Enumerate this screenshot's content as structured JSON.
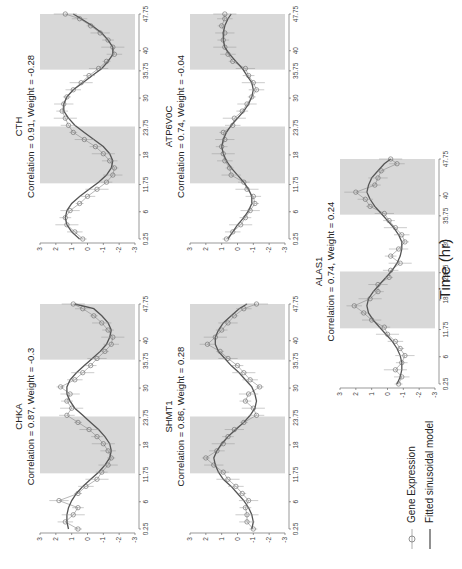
{
  "figure": {
    "x_axis_label": "Time (hr)",
    "legend": [
      {
        "label": "Gene Expression",
        "marker": "circle-line"
      },
      {
        "label": "Fitted sinusoidal model",
        "marker": "line"
      }
    ]
  },
  "chart_data": [
    {
      "type": "line",
      "gene": "CHKA",
      "title": "CHKA",
      "subtitle": "Correlation = 0.87, Weight = -0.3",
      "correlation": 0.87,
      "weight": -0.3,
      "x_ticks": [
        "0.25",
        "6",
        "11.75",
        "18",
        "23.75",
        "30",
        "35.75",
        "40",
        "47.75"
      ],
      "y_ticks": [
        "3",
        "2",
        "1",
        "0",
        "-1",
        "-2",
        "-3"
      ],
      "ylim": [
        -3,
        3
      ],
      "xlim": [
        0.25,
        47.75
      ],
      "shaded_intervals": [
        [
          12,
          24
        ],
        [
          36,
          48
        ]
      ],
      "x": [
        0.25,
        1.75,
        3.25,
        4.75,
        6.25,
        7.75,
        9.25,
        10.75,
        12.25,
        13.75,
        15.25,
        16.75,
        18.25,
        19.75,
        21.25,
        22.75,
        24.25,
        25.75,
        27.25,
        28.75,
        30.25,
        31.75,
        33.25,
        34.75,
        36.25,
        37.75,
        39.25,
        40.75,
        42.25,
        43.75,
        45.25,
        46.75,
        47.75
      ],
      "series": [
        {
          "name": "Gene Expression",
          "values": [
            0.6,
            1.4,
            0.9,
            0.6,
            1.8,
            0.6,
            0.1,
            -0.6,
            -0.9,
            -1.3,
            -1.5,
            -1.3,
            -1.0,
            -0.6,
            -0.1,
            0.6,
            1.3,
            1.0,
            1.3,
            1.1,
            1.7,
            0.8,
            0.3,
            -0.2,
            -0.6,
            -1.1,
            -1.5,
            -1.6,
            -1.3,
            -0.9,
            -0.4,
            0.3,
            0.9
          ]
        },
        {
          "name": "Fitted sinusoidal model",
          "values": [
            1.2,
            1.3,
            1.3,
            1.2,
            1.0,
            0.7,
            0.3,
            -0.2,
            -0.7,
            -1.1,
            -1.4,
            -1.5,
            -1.4,
            -1.1,
            -0.7,
            -0.2,
            0.3,
            0.8,
            1.1,
            1.3,
            1.3,
            1.1,
            0.7,
            0.2,
            -0.3,
            -0.8,
            -1.2,
            -1.4,
            -1.5,
            -1.3,
            -0.9,
            -0.4,
            0.8
          ]
        }
      ]
    },
    {
      "type": "line",
      "gene": "CTH",
      "title": "CTH",
      "subtitle": "Correlation = 0.91, Weight = -0.28",
      "correlation": 0.91,
      "weight": -0.28,
      "x_ticks": [
        "0.25",
        "6",
        "11.75",
        "18",
        "23.75",
        "30",
        "35.75",
        "40",
        "47.75"
      ],
      "y_ticks": [
        "3",
        "2",
        "1",
        "0",
        "-1",
        "-2",
        "-3"
      ],
      "ylim": [
        -3,
        3
      ],
      "xlim": [
        0.25,
        47.75
      ],
      "shaded_intervals": [
        [
          12,
          24
        ],
        [
          36,
          48
        ]
      ],
      "x": [
        0.25,
        1.75,
        3.25,
        4.75,
        6.25,
        7.75,
        9.25,
        10.75,
        12.25,
        13.75,
        15.25,
        16.75,
        18.25,
        19.75,
        21.25,
        22.75,
        24.25,
        25.75,
        27.25,
        28.75,
        30.25,
        31.75,
        33.25,
        34.75,
        36.25,
        37.75,
        39.25,
        40.75,
        42.25,
        43.75,
        45.25,
        46.75,
        47.75
      ],
      "series": [
        {
          "name": "Gene Expression",
          "values": [
            0.3,
            0.8,
            1.3,
            1.4,
            1.1,
            0.5,
            0.0,
            -0.6,
            -1.2,
            -1.6,
            -1.7,
            -1.4,
            -1.0,
            -0.5,
            0.2,
            0.9,
            1.2,
            1.4,
            1.6,
            1.5,
            1.3,
            0.9,
            0.4,
            -0.1,
            -0.7,
            -1.2,
            -1.7,
            -1.6,
            -1.3,
            -0.8,
            -0.2,
            0.5,
            1.4
          ]
        },
        {
          "name": "Fitted sinusoidal model",
          "values": [
            0.5,
            1.0,
            1.3,
            1.4,
            1.3,
            1.0,
            0.5,
            -0.1,
            -0.7,
            -1.2,
            -1.5,
            -1.6,
            -1.4,
            -1.0,
            -0.4,
            0.2,
            0.8,
            1.2,
            1.5,
            1.5,
            1.3,
            0.9,
            0.3,
            -0.3,
            -0.9,
            -1.3,
            -1.6,
            -1.6,
            -1.3,
            -0.9,
            -0.3,
            0.4,
            0.9
          ]
        }
      ]
    },
    {
      "type": "line",
      "gene": "SHMT1",
      "title": "SHMT1",
      "subtitle": "Correlation = 0.86, Weight = 0.28",
      "correlation": 0.86,
      "weight": 0.28,
      "x_ticks": [
        "0.25",
        "6",
        "11.75",
        "18",
        "23.75",
        "30",
        "35.75",
        "40",
        "47.75"
      ],
      "y_ticks": [
        "3",
        "2",
        "1",
        "0",
        "-1",
        "-2",
        "-3"
      ],
      "ylim": [
        -3,
        3
      ],
      "xlim": [
        0.25,
        47.75
      ],
      "shaded_intervals": [
        [
          12,
          24
        ],
        [
          36,
          48
        ]
      ],
      "x": [
        0.25,
        1.75,
        3.25,
        4.75,
        6.25,
        7.75,
        9.25,
        10.75,
        12.25,
        13.75,
        15.25,
        16.75,
        18.25,
        19.75,
        21.25,
        22.75,
        24.25,
        25.75,
        27.25,
        28.75,
        30.25,
        31.75,
        33.25,
        34.75,
        36.25,
        37.75,
        39.25,
        40.75,
        42.25,
        43.75,
        45.25,
        46.75,
        47.75
      ],
      "series": [
        {
          "name": "Gene Expression",
          "values": [
            -1.0,
            -0.6,
            -0.6,
            -0.5,
            -0.7,
            -0.3,
            0.1,
            0.6,
            0.9,
            1.5,
            2.0,
            1.3,
            0.9,
            0.6,
            0.2,
            -0.4,
            -1.2,
            -1.0,
            -0.5,
            -0.7,
            -1.4,
            -0.8,
            -0.4,
            0.0,
            0.6,
            1.1,
            1.9,
            1.4,
            1.0,
            0.6,
            0.2,
            -0.4,
            -1.2
          ]
        },
        {
          "name": "Fitted sinusoidal model",
          "values": [
            -0.9,
            -1.0,
            -0.9,
            -0.7,
            -0.4,
            0.0,
            0.4,
            0.9,
            1.2,
            1.4,
            1.5,
            1.3,
            1.0,
            0.6,
            0.1,
            -0.4,
            -0.8,
            -1.1,
            -1.2,
            -1.1,
            -0.9,
            -0.5,
            -0.1,
            0.4,
            0.8,
            1.2,
            1.4,
            1.4,
            1.2,
            0.9,
            0.4,
            -0.1,
            -0.6
          ]
        }
      ]
    },
    {
      "type": "line",
      "gene": "ATP6V0C",
      "title": "ATP6V0C",
      "subtitle": "Correlation = 0.74, Weight = -0.04",
      "correlation": 0.74,
      "weight": -0.04,
      "x_ticks": [
        "0.25",
        "6",
        "11.75",
        "18",
        "23.75",
        "30",
        "35.75",
        "40",
        "47.75"
      ],
      "y_ticks": [
        "3",
        "2",
        "1",
        "0",
        "-1",
        "-2",
        "-3"
      ],
      "ylim": [
        -3,
        3
      ],
      "xlim": [
        0.25,
        47.75
      ],
      "shaded_intervals": [
        [
          12,
          24
        ],
        [
          36,
          48
        ]
      ],
      "x": [
        0.25,
        1.75,
        3.25,
        4.75,
        6.25,
        7.75,
        9.25,
        10.75,
        12.25,
        13.75,
        15.25,
        16.75,
        18.25,
        19.75,
        21.25,
        22.75,
        24.25,
        25.75,
        27.25,
        28.75,
        30.25,
        31.75,
        33.25,
        34.75,
        36.25,
        37.75,
        39.25,
        40.75,
        42.25,
        43.75,
        45.25,
        46.75,
        47.75
      ],
      "series": [
        {
          "name": "Gene Expression",
          "values": [
            0.7,
            0.3,
            -0.2,
            -0.5,
            -0.8,
            -1.1,
            -1.0,
            -0.6,
            -0.4,
            0.4,
            0.5,
            0.8,
            0.9,
            1.0,
            0.8,
            0.9,
            0.3,
            0.2,
            -0.3,
            -0.6,
            -0.9,
            -1.2,
            -1.0,
            -0.7,
            -0.5,
            0.3,
            0.6,
            0.8,
            0.9,
            0.8,
            1.0,
            0.8,
            0.8
          ]
        },
        {
          "name": "Fitted sinusoidal model",
          "values": [
            0.6,
            0.3,
            0.0,
            -0.4,
            -0.7,
            -0.9,
            -0.9,
            -0.7,
            -0.4,
            0.0,
            0.4,
            0.7,
            0.9,
            1.0,
            0.9,
            0.7,
            0.4,
            0.0,
            -0.4,
            -0.7,
            -0.9,
            -1.0,
            -0.9,
            -0.6,
            -0.3,
            0.1,
            0.5,
            0.8,
            0.9,
            0.9,
            0.8,
            0.6,
            0.4
          ]
        }
      ]
    },
    {
      "type": "line",
      "gene": "ALAS1",
      "title": "ALAS1",
      "subtitle": "Correlation = 0.74, Weight = 0.24",
      "correlation": 0.74,
      "weight": 0.24,
      "x_ticks": [
        "0.25",
        "6",
        "11.75",
        "18",
        "23.75",
        "30",
        "35.75",
        "40",
        "47.75"
      ],
      "y_ticks": [
        "3",
        "2",
        "1",
        "0",
        "-1",
        "-2",
        "-3"
      ],
      "ylim": [
        -3,
        3
      ],
      "xlim": [
        0.25,
        47.75
      ],
      "shaded_intervals": [
        [
          12,
          24
        ],
        [
          36,
          48
        ]
      ],
      "x": [
        0.25,
        1.75,
        3.25,
        4.75,
        6.25,
        7.75,
        9.25,
        10.75,
        12.25,
        13.75,
        15.25,
        16.75,
        18.25,
        19.75,
        21.25,
        22.75,
        24.25,
        25.75,
        27.25,
        28.75,
        30.25,
        31.75,
        33.25,
        34.75,
        36.25,
        37.75,
        39.25,
        40.75,
        42.25,
        43.75,
        45.25,
        46.75,
        47.75
      ],
      "series": [
        {
          "name": "Gene Expression",
          "values": [
            -0.7,
            -0.9,
            -0.5,
            -0.9,
            -1.1,
            -0.8,
            -0.5,
            0.0,
            0.2,
            1.0,
            1.5,
            2.1,
            1.1,
            0.6,
            0.6,
            -0.1,
            -0.2,
            -0.8,
            -0.2,
            -0.7,
            -1.1,
            -0.9,
            -0.5,
            -0.1,
            0.2,
            1.1,
            1.4,
            2.0,
            0.8,
            0.6,
            0.4,
            -0.6,
            -0.2
          ]
        },
        {
          "name": "Fitted sinusoidal model",
          "values": [
            -0.6,
            -0.8,
            -0.9,
            -0.9,
            -0.8,
            -0.6,
            -0.3,
            0.1,
            0.5,
            0.9,
            1.2,
            1.3,
            1.2,
            0.9,
            0.5,
            0.1,
            -0.3,
            -0.6,
            -0.8,
            -0.9,
            -0.9,
            -0.7,
            -0.4,
            0.0,
            0.4,
            0.8,
            1.1,
            1.3,
            1.2,
            1.0,
            0.6,
            0.2,
            -0.2
          ]
        }
      ]
    }
  ]
}
